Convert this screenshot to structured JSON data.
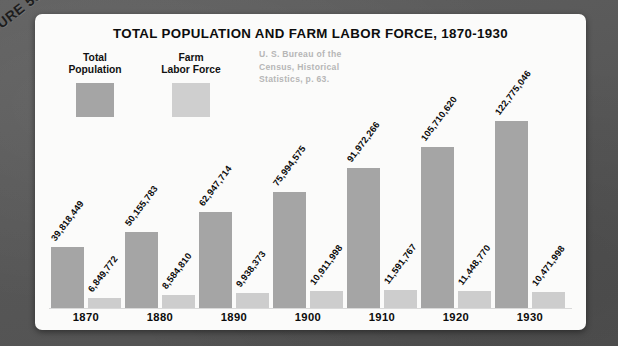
{
  "figure_tag": "FIGURE 55B",
  "card": {
    "title": "TOTAL POPULATION AND FARM LABOR FORCE, 1870-1930",
    "source_lines": [
      "U. S. Bureau of the",
      "Census, Historical",
      "Statistics, p. 63."
    ]
  },
  "legend": {
    "total": {
      "label_line1": "Total",
      "label_line2": "Population",
      "color": "#a5a5a5"
    },
    "farm": {
      "label_line1": "Farm",
      "label_line2": "Labor Force",
      "color": "#cfcfcf"
    }
  },
  "chart_data": {
    "type": "bar",
    "title": "TOTAL POPULATION AND FARM LABOR FORCE, 1870-1930",
    "subtitle": "U. S. Bureau of the Census, Historical Statistics, p. 63.",
    "xlabel": "",
    "ylabel": "",
    "grid": false,
    "legend_position": "top-left",
    "ylim": [
      0,
      130000000
    ],
    "categories": [
      "1870",
      "1880",
      "1890",
      "1900",
      "1910",
      "1920",
      "1930"
    ],
    "series": [
      {
        "name": "Total Population",
        "color": "#a5a5a5",
        "values": [
          39818449,
          50155783,
          62947714,
          75994575,
          91972266,
          105710620,
          122775046
        ],
        "labels": [
          "39,818,449",
          "50,155,783",
          "62,947,714",
          "75,994,575",
          "91,972,266",
          "105,710,620",
          "122,775,046"
        ]
      },
      {
        "name": "Farm Labor Force",
        "color": "#cdcdcd",
        "values": [
          6849772,
          8584810,
          9938373,
          10911998,
          11591767,
          11448770,
          10471998
        ],
        "labels": [
          "6,849,772",
          "8,584,810",
          "9,938,373",
          "10,911,998",
          "11,591,767",
          "11,448,770",
          "10,471,998"
        ]
      }
    ]
  }
}
